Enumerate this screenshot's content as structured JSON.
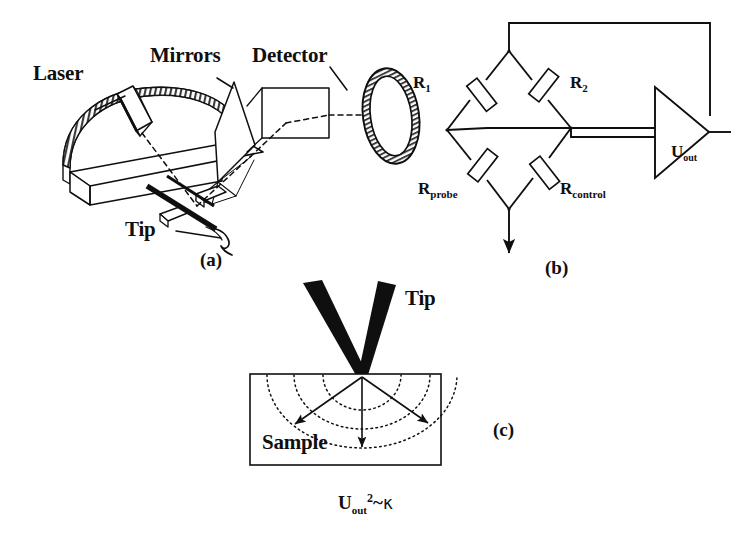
{
  "figure": {
    "caption_panels": [
      "(a)",
      "(b)",
      "(c)"
    ],
    "background_color": "#ffffff",
    "ink_color": "#100f0f"
  },
  "panel_a": {
    "label": "(a)",
    "title_labels": {
      "laser": "Laser",
      "mirrors": "Mirrors",
      "detector": "Detector",
      "tip": "Tip"
    }
  },
  "panel_b": {
    "label": "(b)",
    "resistors": [
      {
        "id": "r1",
        "base": "R",
        "sub": "1"
      },
      {
        "id": "r2",
        "base": "R",
        "sub": "2"
      },
      {
        "id": "rprobe",
        "base": "R",
        "sub": "probe"
      },
      {
        "id": "rcontrol",
        "base": "R",
        "sub": "control"
      }
    ],
    "amplifier_output": {
      "base": "U",
      "sub": "out"
    }
  },
  "panel_c": {
    "label": "(c)",
    "tip_label": "Tip",
    "sample_label": "Sample",
    "equation": {
      "base": "U",
      "sub": "out",
      "sup": "2",
      "relation": "~",
      "symbol": "κ"
    }
  }
}
